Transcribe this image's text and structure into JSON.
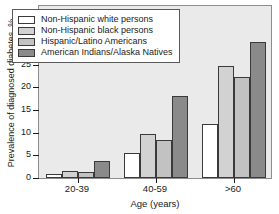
{
  "chart_data": {
    "type": "bar",
    "title": "",
    "subtitle": "",
    "xlabel": "Age (years)",
    "ylabel": "Prevalence of diagnosed diabetes, %",
    "categories": [
      "20-39",
      "40-59",
      ">60"
    ],
    "ylim": [
      0,
      38
    ],
    "yticks": [
      0,
      5,
      10,
      15,
      20,
      25,
      30,
      35
    ],
    "ytick_labels": [
      "0",
      "5",
      "10",
      "15",
      "20",
      "25",
      "30",
      "35"
    ],
    "grid": false,
    "legend_position": "upper-left",
    "series": [
      {
        "name": "Non-Hispanic white persons",
        "color": "#ffffff",
        "values": [
          0.8,
          5.5,
          11.9
        ]
      },
      {
        "name": "Non-Hispanic black persons",
        "color": "#d2d2d2",
        "values": [
          1.6,
          9.7,
          24.5
        ]
      },
      {
        "name": "Hispanic/Latino Americans",
        "color": "#c2c2c2",
        "values": [
          1.3,
          8.3,
          22.0
        ]
      },
      {
        "name": "American Indians/Alaska Natives",
        "color": "#8a8a8a",
        "values": [
          3.7,
          17.9,
          29.7
        ]
      }
    ]
  },
  "figure": {
    "plot_background": "#eaeaea",
    "frame_color": "#8d8d8d",
    "bar_edge_color": "#3a3a3a",
    "text_color": "#1a1a1a"
  }
}
